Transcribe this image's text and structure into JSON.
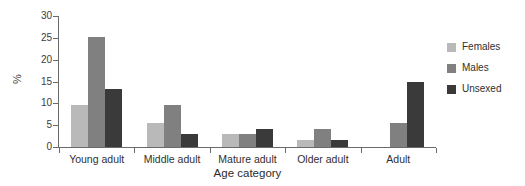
{
  "chart_data": {
    "type": "bar",
    "title": "",
    "xlabel": "Age category",
    "ylabel": "%",
    "categories": [
      "Young adult",
      "Middle adult",
      "Mature adult",
      "Older adult",
      "Adult"
    ],
    "series": [
      {
        "name": "Females",
        "color": "#b9b9b9",
        "values": [
          9.7,
          5.5,
          3.0,
          1.7,
          null
        ]
      },
      {
        "name": "Males",
        "color": "#808080",
        "values": [
          25.2,
          9.6,
          2.9,
          4.2,
          5.5
        ]
      },
      {
        "name": "Unsexed",
        "color": "#3a3a3a",
        "values": [
          13.2,
          2.9,
          4.2,
          1.7,
          14.8
        ]
      }
    ],
    "ylim": [
      0,
      30
    ],
    "yticks": [
      0,
      5,
      10,
      15,
      20,
      25,
      30
    ],
    "grid": false,
    "legend_position": "right"
  },
  "axis": {
    "y_label": "%",
    "x_title": "Age category",
    "y_tick_labels": [
      "0",
      "5",
      "10",
      "15",
      "20",
      "25",
      "30"
    ]
  },
  "legend": {
    "items": [
      {
        "label": "Females"
      },
      {
        "label": "Males"
      },
      {
        "label": "Unsexed"
      }
    ]
  }
}
